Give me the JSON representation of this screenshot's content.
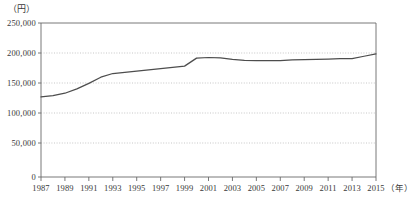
{
  "chart_data": {
    "type": "line",
    "title": "",
    "xlabel": "年",
    "ylabel": "（円）",
    "y_unit_label": "（円）",
    "x_unit_label": "（年）",
    "ylim": [
      0,
      250000
    ],
    "xlim": [
      1987,
      2015
    ],
    "grid": true,
    "grid_style": "dotted-horizontal",
    "legend": "none",
    "line_color": "#4d4d4d",
    "ytick_labels": [
      "250,000",
      "200,000",
      "150,000",
      "100,000",
      "50,000",
      "0"
    ],
    "ytick_values": [
      250000,
      200000,
      150000,
      100000,
      50000,
      0
    ],
    "xtick_labels": [
      "1987",
      "1989",
      "1991",
      "1993",
      "1995",
      "1997",
      "1999",
      "2001",
      "2003",
      "2005",
      "2007",
      "2009",
      "2011",
      "2013",
      "2015"
    ],
    "xtick_values": [
      1987,
      1989,
      1991,
      1993,
      1995,
      1997,
      1999,
      2001,
      2003,
      2005,
      2007,
      2009,
      2011,
      2013,
      2015
    ],
    "x": [
      1987,
      1988,
      1989,
      1990,
      1991,
      1992,
      1993,
      1994,
      1995,
      1996,
      1997,
      1998,
      1999,
      2000,
      2001,
      2002,
      2003,
      2004,
      2005,
      2006,
      2007,
      2008,
      2009,
      2010,
      2011,
      2012,
      2013,
      2014,
      2015
    ],
    "values": [
      130000,
      132000,
      136000,
      143000,
      152000,
      162000,
      168000,
      170000,
      172000,
      174000,
      176000,
      178000,
      180000,
      193000,
      194000,
      193500,
      191000,
      189500,
      189000,
      189000,
      189000,
      190000,
      190500,
      191000,
      191500,
      192000,
      192000,
      196000,
      200000
    ],
    "series_name": ""
  }
}
